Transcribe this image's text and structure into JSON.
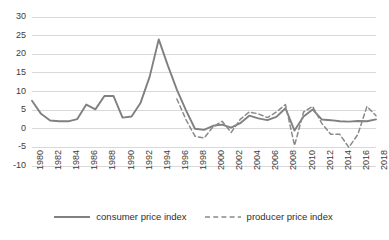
{
  "chart_data": {
    "type": "line",
    "title": "",
    "xlabel": "",
    "ylabel": "",
    "xlim": [
      1980,
      2018
    ],
    "ylim": [
      -10,
      30
    ],
    "yticks": [
      30,
      25,
      20,
      15,
      10,
      5,
      0,
      -5,
      -10
    ],
    "xticks": [
      1980,
      1982,
      1984,
      1986,
      1988,
      1990,
      1992,
      1994,
      1996,
      1998,
      2000,
      2002,
      2004,
      2006,
      2008,
      2010,
      2012,
      2014,
      2016,
      2018
    ],
    "grid": true,
    "legend_position": "bottom",
    "x": [
      1980,
      1981,
      1982,
      1983,
      1984,
      1985,
      1986,
      1987,
      1988,
      1989,
      1990,
      1991,
      1992,
      1993,
      1994,
      1995,
      1996,
      1997,
      1998,
      1999,
      2000,
      2001,
      2002,
      2003,
      2004,
      2005,
      2006,
      2007,
      2008,
      2009,
      2010,
      2011,
      2012,
      2013,
      2014,
      2015,
      2016,
      2017,
      2018
    ],
    "series": [
      {
        "name": "consumer price index",
        "style": "solid",
        "color": "#808080",
        "values": [
          7.5,
          4.0,
          2.2,
          2.0,
          2.0,
          2.6,
          6.5,
          5.2,
          8.8,
          8.8,
          3.0,
          3.3,
          7.0,
          14.0,
          24.0,
          17.0,
          10.5,
          5.0,
          0.0,
          -0.3,
          0.8,
          1.1,
          0.3,
          1.5,
          3.5,
          2.8,
          2.3,
          3.2,
          5.5,
          -0.5,
          3.3,
          5.2,
          2.5,
          2.3,
          2.0,
          1.9,
          2.1,
          2.0,
          2.5
        ],
        "legend_label": "consumer price index"
      },
      {
        "name": "producer price index",
        "style": "dashed",
        "color": "#8a8a8a",
        "values": [
          null,
          null,
          null,
          null,
          null,
          null,
          null,
          null,
          null,
          null,
          null,
          null,
          null,
          null,
          null,
          null,
          8.0,
          2.5,
          -2.0,
          -2.5,
          0.5,
          2.0,
          -1.0,
          2.5,
          4.5,
          4.0,
          3.0,
          4.5,
          6.5,
          -4.5,
          4.5,
          6.0,
          1.5,
          -1.5,
          -1.5,
          -5.0,
          -1.5,
          6.0,
          3.5
        ],
        "legend_label": "producer price index"
      }
    ]
  },
  "legend": {
    "consumer_label": "consumer price index",
    "producer_label": "producer price index"
  },
  "colors": {
    "grid": "#d9d9d9",
    "axis_text": "#3b3b3b",
    "series_consumer": "#808080",
    "series_producer": "#8a8a8a",
    "background": "#ffffff"
  }
}
